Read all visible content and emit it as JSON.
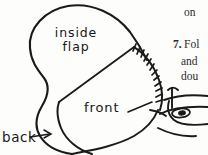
{
  "page": {
    "background_color": "#fdfdfc",
    "ink_color": "#161616"
  },
  "illustration": {
    "name": "sewn-pouch-diagram",
    "description": "Hand-drawn line illustration of a rounded pouch with an inside flap, a front panel edged with whip stitches, and a hand holding a needle at lower right",
    "parts": [
      {
        "id": "inside-flap",
        "label": "inside flap",
        "shape": "large rounded oval upper-left body"
      },
      {
        "id": "front",
        "label": "front",
        "shape": "rounded panel lower-right overlapping the body"
      },
      {
        "id": "back",
        "label": "back",
        "shape": "outer contour at lower left, indicated by arrow"
      },
      {
        "id": "stitch-edge",
        "label": "",
        "shape": "curved seam with perpendicular whip stitch marks along upper-right edge of front panel"
      },
      {
        "id": "hand-with-needle",
        "label": "",
        "shape": "line drawing of fingers pinching a threaded needle at lower right"
      }
    ]
  },
  "labels": {
    "inside_flap_line1": "inside",
    "inside_flap_line2": "flap",
    "front": "front",
    "back": "back"
  },
  "printed_text": {
    "fragment_on": "on",
    "step_number": "7.",
    "step_line1": "Fol",
    "step_line2": "and",
    "step_line3": "dou"
  }
}
